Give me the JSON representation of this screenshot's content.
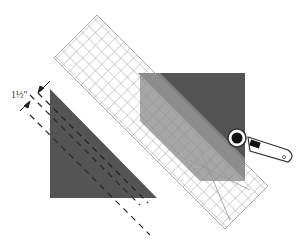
{
  "diagram": {
    "measurement_label": "1½\"",
    "colors": {
      "fabric": "#545454",
      "fabric_under_ruler": "#8a8a8a",
      "ruler_grid": "#b5b5b5",
      "cutter_body": "#ffffff",
      "cutter_blade": "#111111",
      "dashed_lines": "#333333"
    },
    "elements": [
      {
        "name": "left-triangle",
        "description": "Dark fabric triangle with dashed cutting lines"
      },
      {
        "name": "right-square",
        "description": "Dark fabric square partially covered by ruler"
      },
      {
        "name": "quilting-ruler",
        "description": "Grid ruler placed diagonally"
      },
      {
        "name": "rotary-cutter",
        "description": "Rotary cutter positioned at ruler edge"
      },
      {
        "name": "dimension-marker",
        "description": "Spacing indicator between cutting lines"
      }
    ]
  }
}
